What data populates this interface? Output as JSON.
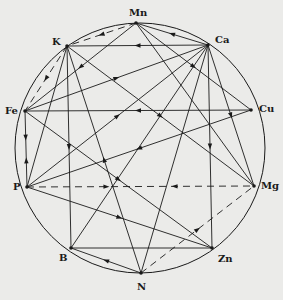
{
  "diagram": {
    "type": "element-interaction-wheel",
    "circle": {
      "cx": 140,
      "cy": 148,
      "r": 125
    },
    "colors": {
      "ink": "#1a1a1a",
      "background": "#ebebe9"
    },
    "nodes": [
      {
        "id": "Mn",
        "label": "Mn",
        "x": 136,
        "y": 23,
        "lx": 129,
        "ly": 8
      },
      {
        "id": "Ca",
        "label": "Ca",
        "x": 208,
        "y": 45,
        "lx": 215,
        "ly": 35
      },
      {
        "id": "Cu",
        "label": "Cu",
        "x": 251,
        "y": 110,
        "lx": 259,
        "ly": 104
      },
      {
        "id": "Mg",
        "label": "Mg",
        "x": 254,
        "y": 186,
        "lx": 261,
        "ly": 181
      },
      {
        "id": "Zn",
        "label": "Zn",
        "x": 212,
        "y": 248,
        "lx": 218,
        "ly": 254
      },
      {
        "id": "N",
        "label": "N",
        "x": 141,
        "y": 273,
        "lx": 137,
        "ly": 282
      },
      {
        "id": "B",
        "label": "B",
        "x": 71,
        "y": 248,
        "lx": 59,
        "ly": 253
      },
      {
        "id": "P",
        "label": "P",
        "x": 27,
        "y": 187,
        "lx": 13,
        "ly": 182
      },
      {
        "id": "Fe",
        "label": "Fe",
        "x": 25,
        "y": 111,
        "lx": 5,
        "ly": 106
      },
      {
        "id": "K",
        "label": "K",
        "x": 67,
        "y": 46,
        "lx": 52,
        "ly": 37
      }
    ],
    "edges": [
      {
        "from": "Mn",
        "to": "K",
        "style": "dashed",
        "arrow": "to"
      },
      {
        "from": "K",
        "to": "Fe",
        "style": "dashed",
        "arrow": "to"
      },
      {
        "from": "P",
        "to": "Mg",
        "style": "dashed",
        "arrow": "both"
      },
      {
        "from": "N",
        "to": "Mg",
        "style": "dashed",
        "arrow": "to"
      },
      {
        "from": "Ca",
        "to": "K",
        "style": "solid",
        "arrow": "to"
      },
      {
        "from": "Ca",
        "to": "Mn",
        "style": "solid",
        "arrow": "to"
      },
      {
        "from": "Mn",
        "to": "Fe",
        "style": "solid",
        "arrow": "to"
      },
      {
        "from": "Mn",
        "to": "Cu",
        "style": "solid",
        "arrow": "to"
      },
      {
        "from": "Cu",
        "to": "Fe",
        "style": "solid",
        "arrow": "to"
      },
      {
        "from": "Fe",
        "to": "Ca",
        "style": "solid",
        "arrow": "to"
      },
      {
        "from": "Cu",
        "to": "P",
        "style": "solid",
        "arrow": "to"
      },
      {
        "from": "K",
        "to": "P",
        "style": "solid",
        "arrow": "none"
      },
      {
        "from": "K",
        "to": "B",
        "style": "solid",
        "arrow": "to"
      },
      {
        "from": "N",
        "to": "K",
        "style": "solid",
        "arrow": "to"
      },
      {
        "from": "K",
        "to": "Mg",
        "style": "solid",
        "arrow": "to"
      },
      {
        "from": "Fe",
        "to": "P",
        "style": "solid",
        "arrow": "both"
      },
      {
        "from": "P",
        "to": "Ca",
        "style": "solid",
        "arrow": "to"
      },
      {
        "from": "Fe",
        "to": "Zn",
        "style": "solid",
        "arrow": "to"
      },
      {
        "from": "P",
        "to": "Zn",
        "style": "solid",
        "arrow": "to"
      },
      {
        "from": "Ca",
        "to": "Zn",
        "style": "solid",
        "arrow": "to"
      },
      {
        "from": "Ca",
        "to": "Mg",
        "style": "solid",
        "arrow": "to"
      },
      {
        "from": "Ca",
        "to": "B",
        "style": "solid",
        "arrow": "none"
      },
      {
        "from": "Ca",
        "to": "N",
        "style": "solid",
        "arrow": "none"
      },
      {
        "from": "Zn",
        "to": "B",
        "style": "solid",
        "arrow": "none"
      },
      {
        "from": "N",
        "to": "B",
        "style": "solid",
        "arrow": "to"
      },
      {
        "from": "Mn",
        "to": "Mg",
        "style": "solid",
        "arrow": "none"
      }
    ]
  }
}
